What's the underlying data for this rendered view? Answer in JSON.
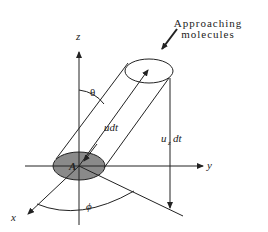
{
  "diagram": {
    "title_annotation": {
      "line1": "Approaching",
      "line2": "molecules"
    },
    "axes": {
      "z": "z",
      "y": "y",
      "x": "x"
    },
    "labels": {
      "theta": "θ",
      "phi": "ϕ",
      "area": "A",
      "slant_length": "udt",
      "vertical_height_u": "u",
      "vertical_height_sub": "z",
      "vertical_height_dt": "dt"
    },
    "colors": {
      "stroke": "#222222",
      "area_fill": "#8a8a8a",
      "background": "#ffffff"
    }
  }
}
